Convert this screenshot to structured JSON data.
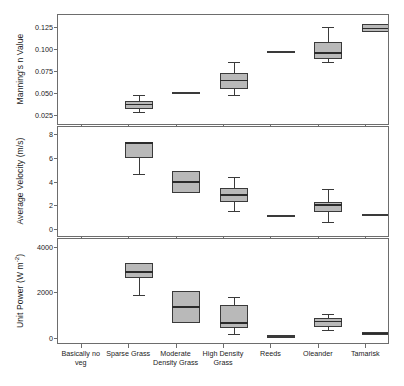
{
  "chart_data": {
    "type": "box",
    "title": "",
    "xlabel": "",
    "categories": [
      "Basically no veg",
      "Sparse Grass",
      "Moderate Density Grass",
      "High Density Grass",
      "Reeds",
      "Oleander",
      "Tamarisk"
    ],
    "panels": [
      {
        "id": "mannings-n",
        "ylabel": "Manning's n Value",
        "ylabel_plain": "Manning's n Value",
        "ylim": [
          0.015,
          0.138
        ],
        "yticks": [
          0.025,
          0.05,
          0.075,
          0.1,
          0.125
        ],
        "ytick_labels": [
          "0.025",
          "0.050",
          "0.075",
          "0.100",
          "0.125"
        ],
        "grid": false,
        "boxes": [
          {
            "category": "Basically no veg",
            "whisker_low": 0.029,
            "q1": 0.032,
            "median": 0.037,
            "q3": 0.041,
            "whisker_high": 0.048,
            "degenerate": false
          },
          {
            "category": "Sparse Grass",
            "whisker_low": 0.05,
            "q1": 0.05,
            "median": 0.05,
            "q3": 0.051,
            "whisker_high": 0.051,
            "degenerate": true
          },
          {
            "category": "Moderate Density Grass",
            "whisker_low": 0.048,
            "q1": 0.055,
            "median": 0.064,
            "q3": 0.072,
            "whisker_high": 0.085,
            "degenerate": false
          },
          {
            "category": "High Density Grass",
            "whisker_low": 0.096,
            "q1": 0.096,
            "median": 0.096,
            "q3": 0.097,
            "whisker_high": 0.097,
            "degenerate": true
          },
          {
            "category": "Reeds",
            "whisker_low": 0.085,
            "q1": 0.088,
            "median": 0.095,
            "q3": 0.108,
            "whisker_high": 0.125,
            "degenerate": false
          },
          {
            "category": "Oleander",
            "whisker_low": 0.119,
            "q1": 0.119,
            "median": 0.123,
            "q3": 0.128,
            "whisker_high": 0.128,
            "degenerate": false
          },
          {
            "category": "Tamarisk",
            "whisker_low": 0.106,
            "q1": 0.112,
            "median": 0.115,
            "q3": 0.121,
            "whisker_high": 0.125,
            "degenerate": false
          }
        ]
      },
      {
        "id": "average-velocity",
        "ylabel": "Average Velocity (m/s)",
        "ylabel_plain": "Average Velocity (m/s)",
        "ylim": [
          -0.6,
          8.6
        ],
        "yticks": [
          0,
          2,
          4,
          6,
          8
        ],
        "ytick_labels": [
          "0",
          "2",
          "4",
          "6",
          "8"
        ],
        "grid": false,
        "boxes": [
          {
            "category": "Basically no veg",
            "whisker_low": 4.6,
            "q1": 6.0,
            "median": 7.25,
            "q3": 7.3,
            "whisker_high": 7.35,
            "degenerate": false
          },
          {
            "category": "Sparse Grass",
            "whisker_low": 3.05,
            "q1": 3.05,
            "median": 3.95,
            "q3": 4.9,
            "whisker_high": 4.9,
            "degenerate": false
          },
          {
            "category": "Moderate Density Grass",
            "whisker_low": 1.5,
            "q1": 2.25,
            "median": 2.85,
            "q3": 3.45,
            "whisker_high": 4.35,
            "degenerate": false
          },
          {
            "category": "High Density Grass",
            "whisker_low": 1.1,
            "q1": 1.1,
            "median": 1.12,
            "q3": 1.15,
            "whisker_high": 1.15,
            "degenerate": true
          },
          {
            "category": "Reeds",
            "whisker_low": 0.55,
            "q1": 1.45,
            "median": 2.0,
            "q3": 2.3,
            "whisker_high": 3.35,
            "degenerate": false
          },
          {
            "category": "Oleander",
            "whisker_low": 1.1,
            "q1": 1.1,
            "median": 1.15,
            "q3": 1.2,
            "whisker_high": 1.2,
            "degenerate": true
          },
          {
            "category": "Tamarisk",
            "whisker_low": 0.6,
            "q1": 1.0,
            "median": 1.35,
            "q3": 1.6,
            "whisker_high": 1.95,
            "degenerate": false
          }
        ]
      },
      {
        "id": "unit-power",
        "ylabel": "Unit Power (W m-2)",
        "ylabel_html": "Unit Power (W m<sup>-2</sup>)",
        "ylim": [
          -240,
          4350
        ],
        "yticks": [
          0,
          2000,
          4000
        ],
        "ytick_labels": [
          "0",
          "2000",
          "4000"
        ],
        "grid": false,
        "boxes": [
          {
            "category": "Basically no veg",
            "whisker_low": 1890,
            "q1": 2620,
            "median": 2900,
            "q3": 3290,
            "whisker_high": 3300,
            "degenerate": false
          },
          {
            "category": "Sparse Grass",
            "whisker_low": 640,
            "q1": 640,
            "median": 1350,
            "q3": 2060,
            "whisker_high": 2060,
            "degenerate": false
          },
          {
            "category": "Moderate Density Grass",
            "whisker_low": 160,
            "q1": 420,
            "median": 650,
            "q3": 1450,
            "whisker_high": 1790,
            "degenerate": false
          },
          {
            "category": "High Density Grass",
            "whisker_low": 40,
            "q1": 40,
            "median": 50,
            "q3": 60,
            "whisker_high": 60,
            "degenerate": true
          },
          {
            "category": "Reeds",
            "whisker_low": 330,
            "q1": 480,
            "median": 700,
            "q3": 860,
            "whisker_high": 1050,
            "degenerate": false
          },
          {
            "category": "Oleander",
            "whisker_low": 140,
            "q1": 150,
            "median": 190,
            "q3": 240,
            "whisker_high": 250,
            "degenerate": false
          },
          {
            "category": "Tamarisk",
            "whisker_low": 200,
            "q1": 250,
            "median": 330,
            "q3": 430,
            "whisker_high": 450,
            "degenerate": false
          }
        ]
      }
    ],
    "style": {
      "box_fill": "#b9b9b9",
      "box_stroke": "#3a3a3a",
      "median_color": "#2b2b2b",
      "frame_color": "#6d6d6d",
      "text_color": "#1b1b1b",
      "background": "#ffffff"
    }
  }
}
